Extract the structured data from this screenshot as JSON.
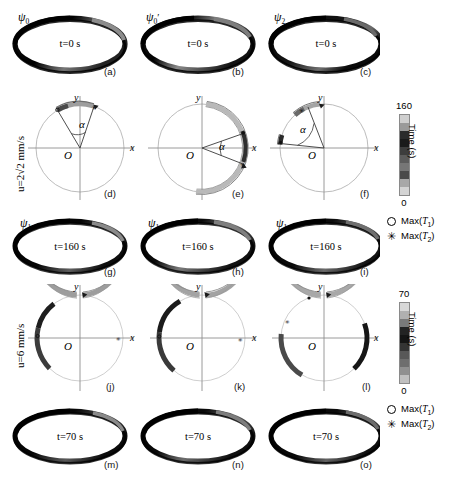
{
  "figure": {
    "rows": [
      {
        "id": "row-top-rings",
        "kind": "ring",
        "panels": [
          {
            "label": "(a)",
            "psi": "ψ",
            "psi_sub": "0",
            "psi_prime": "",
            "time": "t=0 s"
          },
          {
            "label": "(b)",
            "psi": "ψ",
            "psi_sub": "0",
            "psi_prime": "′",
            "time": "t=0 s"
          },
          {
            "label": "(c)",
            "psi": "ψ",
            "psi_sub": "2",
            "psi_prime": "",
            "time": "t=0 s"
          }
        ]
      },
      {
        "id": "row-circles-1",
        "kind": "circle",
        "side_label": "u=2√2 mm/s",
        "panels": [
          {
            "label": "(d)",
            "alpha": "α",
            "x": "x",
            "y": "y",
            "origin": "O"
          },
          {
            "label": "(e)",
            "alpha": "α",
            "x": "x",
            "y": "y",
            "origin": "O"
          },
          {
            "label": "(f)",
            "alpha": "α",
            "x": "x",
            "y": "y",
            "origin": "O"
          }
        ]
      },
      {
        "id": "row-mid-rings",
        "kind": "ring",
        "panels": [
          {
            "label": "(g)",
            "psi": "ψ",
            "psi_sub": "1",
            "psi_prime": "",
            "time": "t=160 s"
          },
          {
            "label": "(h)",
            "psi": "ψ",
            "psi_sub": "1",
            "psi_prime": "",
            "time": "t=160 s"
          },
          {
            "label": "(i)",
            "psi": "ψ",
            "psi_sub": "1",
            "psi_prime": "",
            "time": "t=160 s"
          }
        ]
      },
      {
        "id": "row-circles-2",
        "kind": "circle",
        "side_label": "u=6 mm/s",
        "panels": [
          {
            "label": "(j)",
            "alpha": "",
            "x": "x",
            "y": "y",
            "origin": "O"
          },
          {
            "label": "(k)",
            "alpha": "",
            "x": "x",
            "y": "y",
            "origin": "O"
          },
          {
            "label": "(l)",
            "alpha": "",
            "x": "x",
            "y": "y",
            "origin": "O"
          }
        ]
      },
      {
        "id": "row-bottom-rings",
        "kind": "ring",
        "panels": [
          {
            "label": "(m)",
            "psi": "",
            "psi_sub": "",
            "psi_prime": "",
            "time": "t=70 s"
          },
          {
            "label": "(n)",
            "psi": "",
            "psi_sub": "",
            "psi_prime": "",
            "time": "t=70 s"
          },
          {
            "label": "(o)",
            "psi": "",
            "psi_sub": "",
            "psi_prime": "",
            "time": "t=70 s"
          }
        ]
      }
    ],
    "colorbars": [
      {
        "id": "colorbar-160",
        "title": "Time (s)",
        "max": "160",
        "min": "0",
        "segments": [
          "#cfcfcf",
          "#9a9a9a",
          "#2b2b2b",
          "#1a1a1a",
          "#3d3d3d",
          "#5c5c5c",
          "#767676",
          "#4a4a4a",
          "#a8a8a8",
          "#d4d4d4"
        ]
      },
      {
        "id": "colorbar-70",
        "title": "Time (s)",
        "max": "70",
        "min": "0",
        "segments": [
          "#d8d8d8",
          "#b0b0b0",
          "#7a7a7a",
          "#232323",
          "#151515",
          "#343434",
          "#585858",
          "#6e6e6e",
          "#909090",
          "#c0c0c0"
        ]
      }
    ],
    "legends": [
      {
        "id": "legend-top",
        "entries": [
          {
            "symbol": "circle",
            "label_prefix": "Max(",
            "label_var": "T",
            "label_sub": "1",
            "label_suffix": ")"
          },
          {
            "symbol": "asterisk",
            "glyph": "✳",
            "label_prefix": "Max(",
            "label_var": "T",
            "label_sub": "2",
            "label_suffix": ")"
          }
        ]
      },
      {
        "id": "legend-bottom",
        "entries": [
          {
            "symbol": "circle",
            "label_prefix": "Max(",
            "label_var": "T",
            "label_sub": "1",
            "label_suffix": ")"
          },
          {
            "symbol": "asterisk",
            "glyph": "✳",
            "label_prefix": "Max(",
            "label_var": "T",
            "label_sub": "2",
            "label_suffix": ")"
          }
        ]
      }
    ]
  },
  "chart_data": {
    "type": "diagram",
    "columns": 3,
    "panel_labels": [
      "(a)",
      "(b)",
      "(c)",
      "(d)",
      "(e)",
      "(f)",
      "(g)",
      "(h)",
      "(i)",
      "(j)",
      "(k)",
      "(l)",
      "(m)",
      "(n)",
      "(o)"
    ],
    "speed_conditions": [
      {
        "row": 2,
        "u": "2√2 mm/s",
        "u_value": 2.828,
        "unit": "mm/s",
        "duration_s": 160
      },
      {
        "row": 4,
        "u": "6 mm/s",
        "u_value": 6,
        "unit": "mm/s",
        "duration_s": 70
      }
    ],
    "time_annotations": [
      "t=0 s",
      "t=0 s",
      "t=0 s",
      "t=160 s",
      "t=160 s",
      "t=160 s",
      "t=70 s",
      "t=70 s",
      "t=70 s"
    ],
    "state_labels": [
      "ψ₀",
      "ψ₀′",
      "ψ₂",
      "ψ₁",
      "ψ₁",
      "ψ₁"
    ],
    "colorbars": [
      {
        "label": "Time (s)",
        "min": 0,
        "max": 160,
        "cmap": "grayscale"
      },
      {
        "label": "Time (s)",
        "min": 0,
        "max": 70,
        "cmap": "grayscale"
      }
    ],
    "legend_entries": [
      "Max(T1)",
      "Max(T2)"
    ],
    "angular_sweeps_deg": [
      {
        "panel": "(d)",
        "alpha_deg": 38,
        "start_deg": 118,
        "end_deg": 80
      },
      {
        "panel": "(e)",
        "alpha_deg": 44,
        "start_deg": 22,
        "end_deg": -22
      },
      {
        "panel": "(f)",
        "alpha_deg": 84,
        "start_deg": 180,
        "end_deg": 96
      },
      {
        "panel": "(j)",
        "alpha_deg": 330,
        "start_deg": 95,
        "end_deg": -235
      },
      {
        "panel": "(k)",
        "alpha_deg": 345,
        "start_deg": 95,
        "end_deg": -250
      },
      {
        "panel": "(l)",
        "alpha_deg": 350,
        "start_deg": 95,
        "end_deg": -255
      }
    ],
    "axes": {
      "x_label": "x",
      "y_label": "y",
      "origin_label": "O",
      "angle_label": "α"
    }
  }
}
